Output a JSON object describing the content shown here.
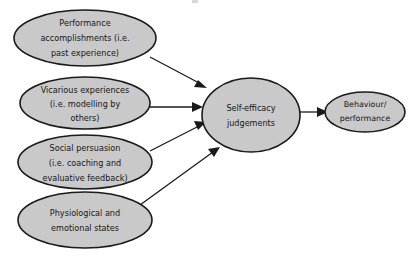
{
  "diagram": {
    "type": "flow-diagram",
    "background_color": "#ffffff",
    "node_fill_color": "#c9c9c9",
    "node_stroke_color": "#1a1a1a",
    "text_color": "#161616",
    "nodes": [
      {
        "id": "performance-accomplishments",
        "lines": [
          "Performance",
          "accomplishments (i.e.",
          "past experience)"
        ],
        "cx": 85,
        "cy": 38,
        "rx": 71,
        "ry": 28
      },
      {
        "id": "vicarious-experiences",
        "lines": [
          "Vicarious experiences",
          "(i.e. modelling by",
          "others)"
        ],
        "cx": 85,
        "cy": 103,
        "rx": 65,
        "ry": 26
      },
      {
        "id": "social-persuasion",
        "lines": [
          "Social persuasion",
          "(i.e. coaching and",
          "evaluative feedback)"
        ],
        "cx": 85,
        "cy": 162,
        "rx": 67,
        "ry": 27
      },
      {
        "id": "physiological-emotional-states",
        "lines": [
          "Physiological and",
          "emotional states"
        ],
        "cx": 85,
        "cy": 220,
        "rx": 67,
        "ry": 28
      },
      {
        "id": "self-efficacy-judgements",
        "lines": [
          "Self-efficacy",
          "judgements"
        ],
        "cx": 251,
        "cy": 115,
        "rx": 49,
        "ry": 37
      },
      {
        "id": "behaviour-performance",
        "lines": [
          "Behaviour/",
          "performance"
        ],
        "cx": 365,
        "cy": 112,
        "rx": 40,
        "ry": 20
      }
    ],
    "edges": [
      {
        "id": "edge-performance-to-self-efficacy",
        "from": "performance-accomplishments",
        "to": "self-efficacy-judgements",
        "x1": 150,
        "y1": 57,
        "x2": 206,
        "y2": 87
      },
      {
        "id": "edge-vicarious-to-self-efficacy",
        "from": "vicarious-experiences",
        "to": "self-efficacy-judgements",
        "x1": 150,
        "y1": 107,
        "x2": 201,
        "y2": 107
      },
      {
        "id": "edge-social-to-self-efficacy",
        "from": "social-persuasion",
        "to": "self-efficacy-judgements",
        "x1": 150,
        "y1": 151,
        "x2": 203,
        "y2": 122
      },
      {
        "id": "edge-physiological-to-self-efficacy",
        "from": "physiological-emotional-states",
        "to": "self-efficacy-judgements",
        "x1": 142,
        "y1": 204,
        "x2": 218,
        "y2": 148
      },
      {
        "id": "edge-self-efficacy-to-behaviour",
        "from": "self-efficacy-judgements",
        "to": "behaviour-performance",
        "x1": 300,
        "y1": 112,
        "x2": 326,
        "y2": 112
      }
    ]
  }
}
